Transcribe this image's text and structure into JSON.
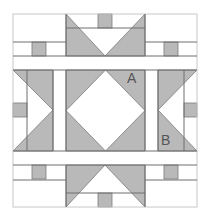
{
  "diagram": {
    "colors": {
      "background": "#ffffff",
      "fabric_gray": "#b9b9b9",
      "seam_line": "#6e6e6e",
      "label": "#555555"
    },
    "labels": {
      "a": "A",
      "b": "B"
    }
  }
}
